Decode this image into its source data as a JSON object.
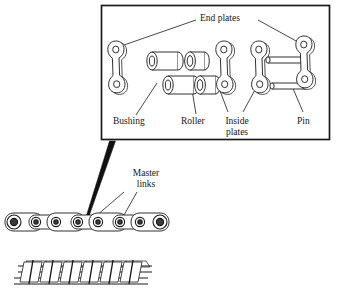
{
  "figure": {
    "type": "technical-exploded-diagram",
    "callout_box": {
      "title": "End plates",
      "labels": [
        {
          "id": "end-plates",
          "text": "End plates"
        },
        {
          "id": "bushing",
          "text": "Bushing"
        },
        {
          "id": "roller",
          "text": "Roller"
        },
        {
          "id": "inside-plates",
          "text_line1": "Inside",
          "text_line2": "plates"
        },
        {
          "id": "pin",
          "text": "Pin"
        }
      ],
      "components": [
        {
          "name": "end-plate-left",
          "kind": "link-plate",
          "holes": 2
        },
        {
          "name": "bushing-upper",
          "kind": "cylinder",
          "style": "long"
        },
        {
          "name": "bushing-lower",
          "kind": "cylinder",
          "style": "long"
        },
        {
          "name": "roller-upper",
          "kind": "cylinder",
          "style": "short"
        },
        {
          "name": "roller-lower",
          "kind": "cylinder",
          "style": "short"
        },
        {
          "name": "inside-plate-1",
          "kind": "link-plate",
          "holes": 2
        },
        {
          "name": "inside-plate-2",
          "kind": "link-plate",
          "holes": 2
        },
        {
          "name": "end-plate-right",
          "kind": "link-plate",
          "holes": 2
        },
        {
          "name": "pin-upper",
          "kind": "pin"
        },
        {
          "name": "pin-lower",
          "kind": "pin"
        }
      ]
    },
    "chain_views": [
      {
        "id": "single-strand-chain",
        "label": "Master links",
        "orientation": "side-elevation",
        "links": 8
      },
      {
        "id": "double-strand-chain",
        "label": "",
        "orientation": "perspective",
        "links": 8
      }
    ],
    "master_links_label": {
      "text_line1": "Master",
      "text_line2": "links"
    },
    "colors": {
      "line": "#1a1a1a",
      "fill": "#ffffff",
      "shade": "#e8e8e8",
      "pointer": "#111111"
    }
  }
}
